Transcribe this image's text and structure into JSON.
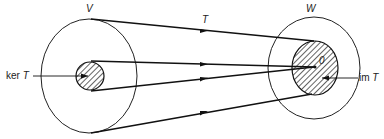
{
  "diagram": {
    "domain_label": "V",
    "codomain_label": "W",
    "map_label": "T",
    "kernel_label_prefix": "ker",
    "kernel_label_var": "T",
    "image_label_prefix": "im",
    "image_label_var": "T",
    "zero_label": "0",
    "colors": {
      "stroke": "#111111",
      "background": "#ffffff"
    }
  }
}
